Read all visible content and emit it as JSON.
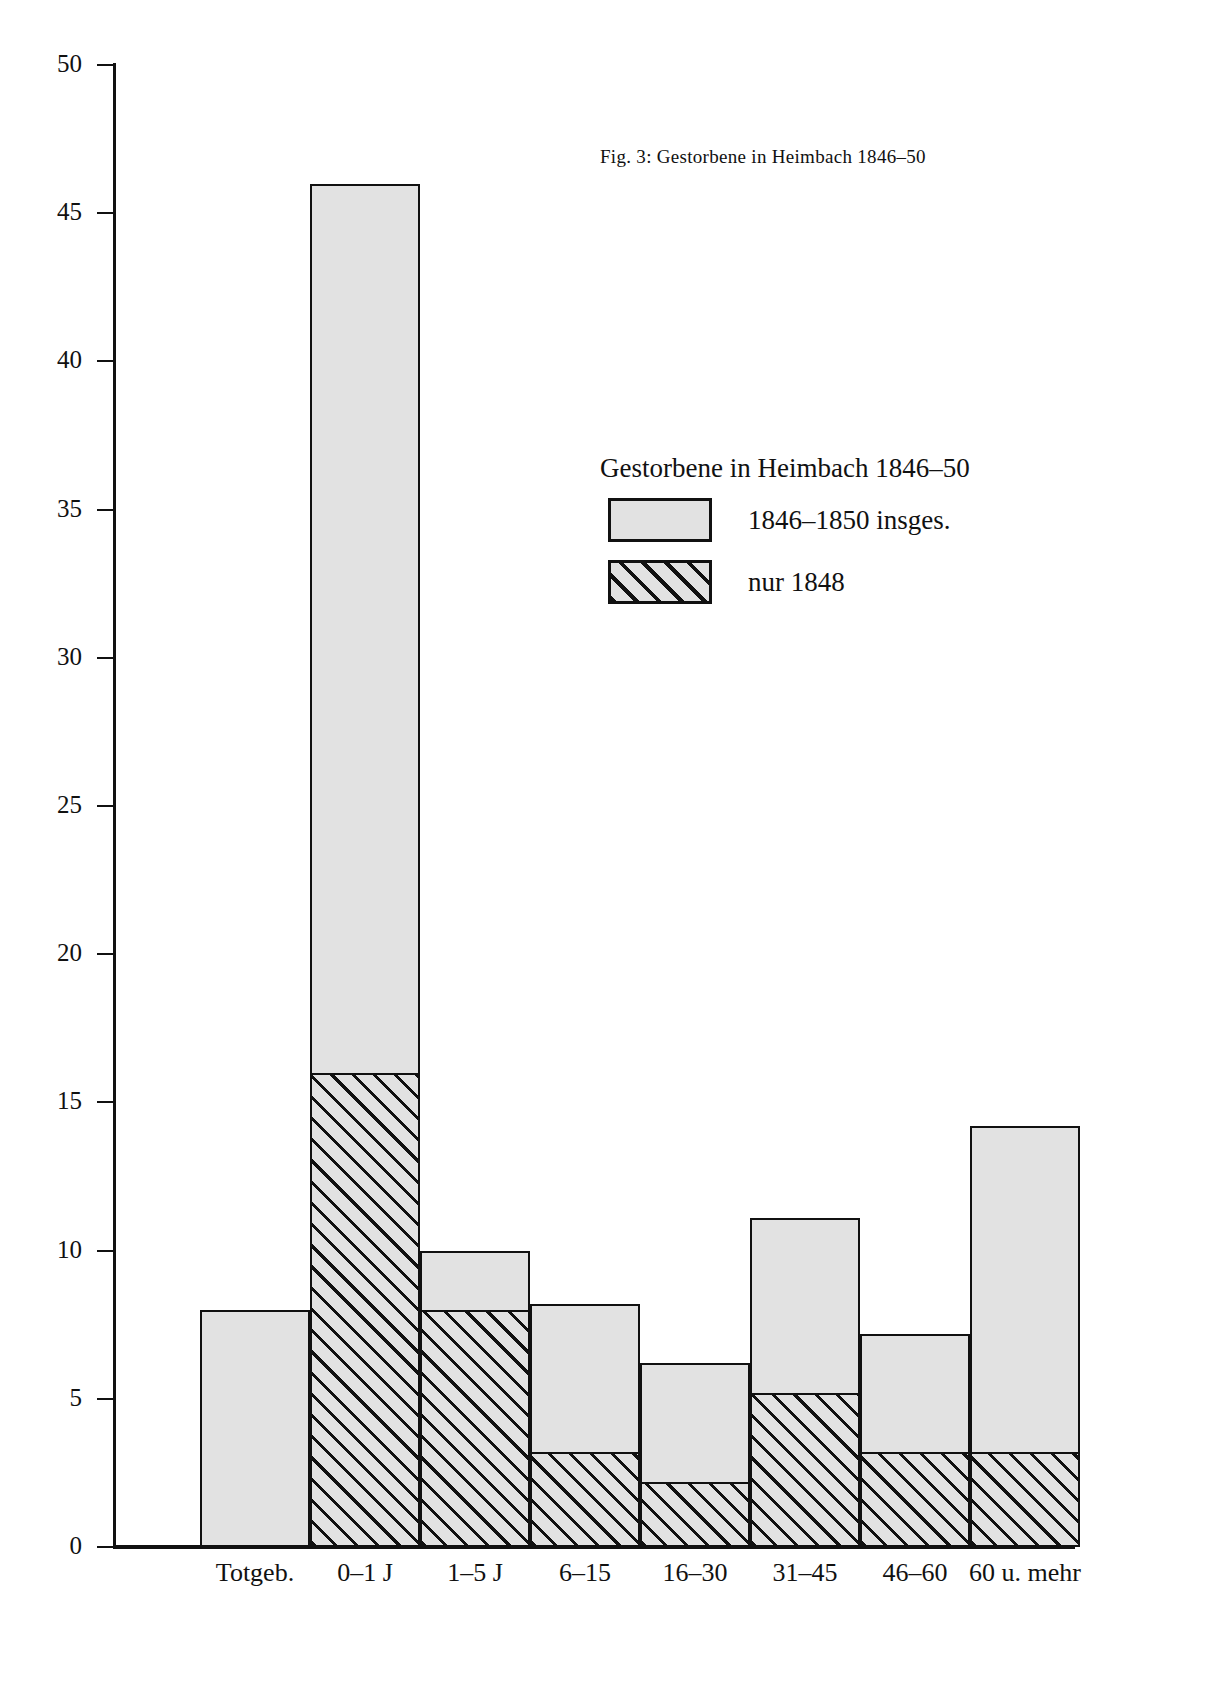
{
  "figure": {
    "caption": "Fig. 3: Gestorbene in Heimbach 1846–50"
  },
  "legend": {
    "title": "Gestorbene in Heimbach 1846–50",
    "entries": [
      {
        "label": "1846–1850 insges.",
        "pattern": "solid-grey"
      },
      {
        "label": "nur 1848",
        "pattern": "diagonal-hatch"
      }
    ]
  },
  "axes": {
    "y_ticks": [
      "50",
      "45",
      "40",
      "35",
      "30",
      "25",
      "20",
      "15",
      "10",
      "5",
      "0"
    ]
  },
  "chart_data": {
    "type": "bar",
    "title": "Gestorbene in Heimbach 1846–50",
    "xlabel": "",
    "ylabel": "",
    "ylim": [
      0,
      50
    ],
    "ytick_step": 5,
    "grid": false,
    "legend_position": "upper-right-inside",
    "overlay": "1848 subset drawn over the 1846-1850 total bars",
    "categories": [
      "Totgeb.",
      "0–1 J",
      "1–5 J",
      "6–15",
      "16–30",
      "31–45",
      "46–60",
      "60 u. mehr"
    ],
    "series": [
      {
        "name": "1846–1850 insges.",
        "values": [
          8,
          46,
          10,
          8.2,
          6.2,
          11.1,
          7.2,
          14.2
        ]
      },
      {
        "name": "nur 1848",
        "values": [
          0,
          16,
          8,
          3.2,
          2.2,
          5.2,
          3.2,
          3.2
        ]
      }
    ],
    "colors": {
      "fill": "#e2e2e2",
      "line": "#111111"
    }
  }
}
